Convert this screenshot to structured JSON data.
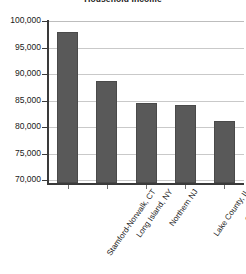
{
  "chart_data": {
    "type": "bar",
    "title": "Household Income",
    "xlabel": "",
    "ylabel": "",
    "categories": [
      "Stamford-Norwalk, CT",
      "Long Island, NY",
      "Northern NJ",
      "Lake County, IL",
      "Central NJ"
    ],
    "values": [
      97900,
      88700,
      84600,
      84200,
      81200
    ],
    "ylim": [
      69500,
      100000
    ],
    "yticks": [
      70000,
      75000,
      80000,
      85000,
      90000,
      95000,
      100000
    ],
    "ytick_labels": [
      "70,000",
      "75,000",
      "80,000",
      "85,000",
      "90,000",
      "95,000",
      "100,000"
    ],
    "grid": true,
    "legend": false,
    "bar_color": "#595959",
    "gridline_color": "#c9c9c9",
    "axis_color": "#3a3a3a",
    "text_color": "#1a1a1a"
  }
}
